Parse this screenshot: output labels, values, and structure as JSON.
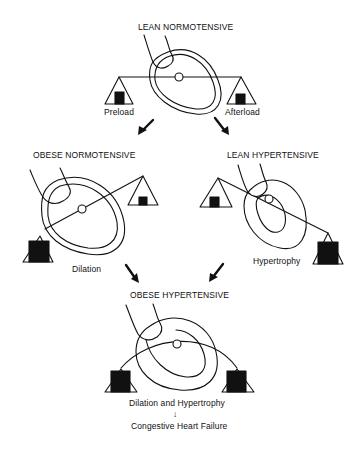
{
  "figure": {
    "panels": [
      {
        "id": "lean-normotensive",
        "title": "LEAN NORMOTENSIVE",
        "left_label": "Preload",
        "right_label": "Afterload",
        "caption": ""
      },
      {
        "id": "obese-normotensive",
        "title": "OBESE NORMOTENSIVE",
        "caption": "Dilation"
      },
      {
        "id": "lean-hypertensive",
        "title": "LEAN HYPERTENSIVE",
        "caption": "Hypertrophy"
      },
      {
        "id": "obese-hypertensive",
        "title": "OBESE HYPERTENSIVE",
        "caption": "Dilation and Hypertrophy"
      }
    ],
    "outcome": "Congestive Heart Failure",
    "arrow_glyph": "↓"
  },
  "colors": {
    "ink": "#111111",
    "background": "#ffffff"
  }
}
